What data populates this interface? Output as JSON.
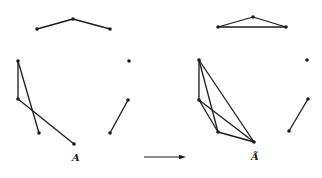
{
  "diagram": {
    "type": "graph-transformation",
    "left_graph": {
      "label": "A",
      "nodes": [
        {
          "id": "l1",
          "x": 37,
          "y": 29
        },
        {
          "id": "l2",
          "x": 73,
          "y": 19
        },
        {
          "id": "l3",
          "x": 110,
          "y": 29
        },
        {
          "id": "l4",
          "x": 129,
          "y": 61
        },
        {
          "id": "l5",
          "x": 18,
          "y": 61
        },
        {
          "id": "l6",
          "x": 18,
          "y": 99
        },
        {
          "id": "l7",
          "x": 39,
          "y": 133
        },
        {
          "id": "l8",
          "x": 74,
          "y": 144
        },
        {
          "id": "l9",
          "x": 128,
          "y": 100
        },
        {
          "id": "l10",
          "x": 110,
          "y": 133
        }
      ],
      "edges": [
        [
          "l1",
          "l2"
        ],
        [
          "l2",
          "l3"
        ],
        [
          "l5",
          "l6"
        ],
        [
          "l5",
          "l7"
        ],
        [
          "l6",
          "l8"
        ],
        [
          "l9",
          "l10"
        ]
      ],
      "label_pos": {
        "x": 72,
        "y": 161
      }
    },
    "right_graph": {
      "label": "Ã",
      "nodes": [
        {
          "id": "r1",
          "x": 218,
          "y": 27
        },
        {
          "id": "r2",
          "x": 253,
          "y": 17
        },
        {
          "id": "r3",
          "x": 286,
          "y": 27
        },
        {
          "id": "r4",
          "x": 307,
          "y": 60
        },
        {
          "id": "r5",
          "x": 199,
          "y": 60
        },
        {
          "id": "r6",
          "x": 199,
          "y": 100
        },
        {
          "id": "r7",
          "x": 218,
          "y": 132
        },
        {
          "id": "r8",
          "x": 254,
          "y": 142
        },
        {
          "id": "r9",
          "x": 308,
          "y": 99
        },
        {
          "id": "r10",
          "x": 289,
          "y": 131
        }
      ],
      "edges": [
        [
          "r1",
          "r2"
        ],
        [
          "r2",
          "r3"
        ],
        [
          "r1",
          "r3"
        ],
        [
          "r5",
          "r6"
        ],
        [
          "r5",
          "r7"
        ],
        [
          "r5",
          "r8"
        ],
        [
          "r6",
          "r7"
        ],
        [
          "r6",
          "r8"
        ],
        [
          "r7",
          "r8"
        ],
        [
          "r9",
          "r10"
        ]
      ],
      "label_pos": {
        "x": 251,
        "y": 160
      }
    },
    "arrow": {
      "x1": 144,
      "y1": 157,
      "x2": 186,
      "y2": 157
    },
    "colors": {
      "stroke": "#1a1a1a",
      "background": "#ffffff"
    }
  }
}
